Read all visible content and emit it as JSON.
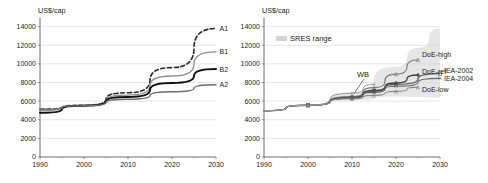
{
  "figure": {
    "panel_left": {
      "name": "sres-scenarios-panel",
      "axis_title": "US$/cap",
      "chart_data": {
        "type": "line",
        "title": "",
        "xlabel": "",
        "ylabel": "US$/cap",
        "xlim": [
          1990,
          2030
        ],
        "ylim": [
          0,
          14500
        ],
        "xticks": [
          1990,
          2000,
          2010,
          2020,
          2030
        ],
        "yticks": [
          0,
          2000,
          4000,
          6000,
          8000,
          10000,
          12000,
          14000
        ],
        "xtick_labels": [
          "1990",
          "2000",
          "2010",
          "2020",
          "2030"
        ],
        "ytick_labels": [
          "0",
          "2000",
          "4000",
          "6000",
          "8000",
          "10000",
          "12000",
          "14000"
        ],
        "grid": true,
        "legend_position": "right-inline",
        "x": [
          1990,
          2000,
          2010,
          2020,
          2030
        ],
        "series": [
          {
            "name": "A1",
            "label": "A1",
            "style": "dashed",
            "color": "#2b2b2b",
            "width": 1.6,
            "values": [
              5150,
              5550,
              6900,
              9600,
              13800
            ]
          },
          {
            "name": "B1",
            "label": "B1",
            "style": "solid",
            "color": "#8c8c8c",
            "width": 1.3,
            "values": [
              5150,
              5550,
              6650,
              8700,
              11300
            ]
          },
          {
            "name": "B2",
            "label": "B2",
            "style": "solid",
            "color": "#111111",
            "width": 2.0,
            "values": [
              4750,
              5500,
              6450,
              7950,
              9450
            ]
          },
          {
            "name": "A2",
            "label": "A2",
            "style": "solid",
            "color": "#6e6e6e",
            "width": 1.5,
            "values": [
              5050,
              5500,
              6200,
              7000,
              7750
            ]
          }
        ]
      }
    },
    "panel_right": {
      "name": "projections-comparison-panel",
      "axis_title": "US$/cap",
      "legend": {
        "swatch_label": "SRES range",
        "swatch_color": "#d2d2d2"
      },
      "annotation": {
        "label": "WB",
        "points_to_year": 2010,
        "points_to_value": 6450
      },
      "chart_data": {
        "type": "line",
        "title": "",
        "xlabel": "",
        "ylabel": "US$/cap",
        "xlim": [
          1990,
          2030
        ],
        "ylim": [
          0,
          14500
        ],
        "xticks": [
          1990,
          2000,
          2010,
          2020,
          2030
        ],
        "yticks": [
          0,
          2000,
          4000,
          6000,
          8000,
          10000,
          12000,
          14000
        ],
        "xtick_labels": [
          "1990",
          "2000",
          "2010",
          "2020",
          "2030"
        ],
        "ytick_labels": [
          "0",
          "2000",
          "4000",
          "6000",
          "8000",
          "10000",
          "12000",
          "14000"
        ],
        "grid": true,
        "legend_position": "right-inline",
        "band": {
          "name": "SRES range",
          "color": "#d2d2d2",
          "x": [
            1990,
            2000,
            2010,
            2020,
            2025,
            2030
          ],
          "upper": [
            5050,
            5600,
            6950,
            9700,
            11700,
            13800
          ],
          "lower": [
            4950,
            5450,
            6100,
            6500,
            6450,
            6400
          ]
        },
        "x": [
          1990,
          2000,
          2010,
          2015,
          2020,
          2025,
          2030
        ],
        "series": [
          {
            "name": "DoE-high",
            "label": "DoE-high",
            "color": "#7a7a7a",
            "width": 1.1,
            "marker": "triangle",
            "values": [
              4980,
              5560,
              6500,
              7450,
              8900,
              10450,
              null
            ]
          },
          {
            "name": "DoE-ref",
            "label": "DoE-ref",
            "color": "#444444",
            "width": 1.4,
            "marker": "diamond",
            "values": [
              4980,
              5560,
              6400,
              7150,
              7950,
              8800,
              null
            ]
          },
          {
            "name": "IEA-2002",
            "label": "IEA-2002",
            "color": "#555555",
            "width": 1.2,
            "marker": "square",
            "values": [
              4980,
              5560,
              6380,
              7050,
              7800,
              null,
              8950
            ]
          },
          {
            "name": "IEA-2004",
            "label": "IEA-2004",
            "color": "#666666",
            "width": 1.2,
            "marker": "cross",
            "values": [
              4980,
              5560,
              6320,
              6950,
              7600,
              null,
              8450
            ]
          },
          {
            "name": "DoE-low",
            "label": "DoE-low",
            "color": "#888888",
            "width": 1.1,
            "marker": "triangle",
            "values": [
              4980,
              5560,
              6250,
              6620,
              7050,
              7500,
              null
            ]
          },
          {
            "name": "WB",
            "label": "WB",
            "color": "#9a9a9a",
            "width": 1.0,
            "marker": "plus",
            "values": [
              4980,
              5560,
              6850,
              7800,
              null,
              null,
              null
            ]
          }
        ]
      }
    }
  }
}
